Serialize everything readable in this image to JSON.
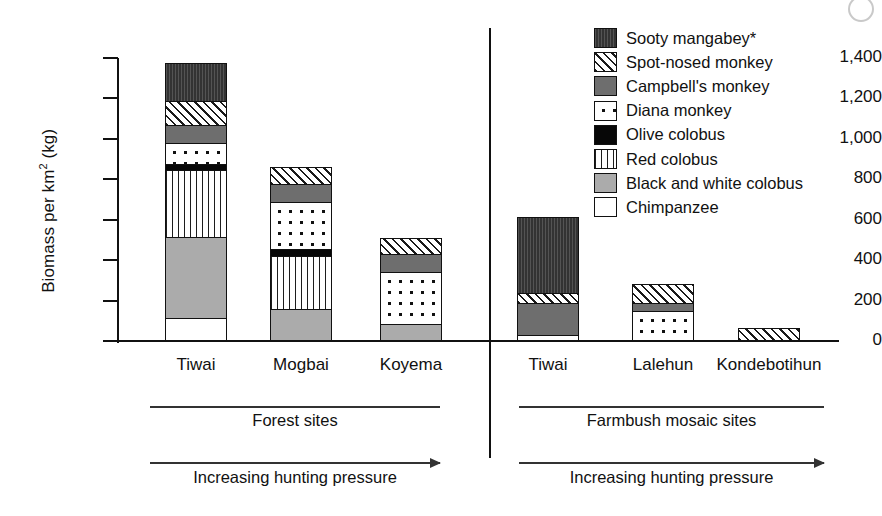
{
  "chart_data": {
    "type": "bar",
    "title": "",
    "xlabel": "",
    "ylabel": "Biomass per km2 (kg)",
    "ylabel_prefix": "Biomass per km",
    "ylabel_sup": "2",
    "ylabel_suffix": " (kg)",
    "stacked": true,
    "ylim": [
      0,
      1400
    ],
    "ytick_values": [
      1400,
      1200,
      1000,
      800,
      600,
      400,
      200,
      0
    ],
    "ytick_labels": [
      "1,400",
      "1,200",
      "1,000",
      "800",
      "600",
      "400",
      "200",
      "0"
    ],
    "grid": false,
    "legend_position": "right",
    "categories": [
      "Tiwai",
      "Mogbai",
      "Koyema",
      "Tiwai",
      "Lalehun",
      "Kondebotihun"
    ],
    "series": [
      {
        "name": "Sooty mangabey*",
        "pattern": "dark-dotted-fill",
        "values": [
          185,
          0,
          0,
          380,
          0,
          0
        ]
      },
      {
        "name": "Spot-nosed monkey",
        "pattern": "diagonal-hatch",
        "values": [
          120,
          80,
          75,
          50,
          90,
          65
        ]
      },
      {
        "name": "Campbell's monkey",
        "pattern": "solid-gray",
        "values": [
          90,
          90,
          90,
          160,
          40,
          0
        ]
      },
      {
        "name": "Diana monkey",
        "pattern": "white-dots",
        "values": [
          105,
          235,
          265,
          25,
          150,
          0
        ]
      },
      {
        "name": "Olive colobus",
        "pattern": "solid-black",
        "values": [
          30,
          35,
          0,
          0,
          0,
          0
        ]
      },
      {
        "name": "Red colobus",
        "pattern": "vertical-stripes",
        "values": [
          330,
          265,
          0,
          0,
          0,
          0
        ]
      },
      {
        "name": "Black and white colobus",
        "pattern": "light-gray",
        "values": [
          405,
          155,
          80,
          0,
          0,
          0
        ]
      },
      {
        "name": "Chimpanzee",
        "pattern": "white",
        "values": [
          110,
          0,
          0,
          0,
          0,
          0
        ]
      }
    ],
    "totals": [
      1375,
      860,
      510,
      615,
      280,
      65
    ],
    "annotations": [
      {
        "group": "forest",
        "caption": "Forest sites",
        "arrow_caption": "Increasing hunting pressure"
      },
      {
        "group": "farmbush",
        "caption": "Farmbush mosaic sites",
        "arrow_caption": "Increasing hunting pressure"
      }
    ]
  },
  "legend": {
    "items": [
      {
        "label": "Sooty mangabey*"
      },
      {
        "label": "Spot-nosed monkey"
      },
      {
        "label": "Campbell's monkey"
      },
      {
        "label": "Diana monkey"
      },
      {
        "label": "Olive colobus"
      },
      {
        "label": "Red colobus"
      },
      {
        "label": "Black and white colobus"
      },
      {
        "label": "Chimpanzee"
      }
    ]
  },
  "axis": {
    "ticks": [
      {
        "label": "1,400"
      },
      {
        "label": "1,200"
      },
      {
        "label": "1,000"
      },
      {
        "label": "800"
      },
      {
        "label": "600"
      },
      {
        "label": "400"
      },
      {
        "label": "200"
      },
      {
        "label": "0"
      }
    ]
  },
  "xaxis": {
    "labels": [
      {
        "label": "Tiwai"
      },
      {
        "label": "Mogbai"
      },
      {
        "label": "Koyema"
      },
      {
        "label": "Tiwai"
      },
      {
        "label": "Lalehun"
      },
      {
        "label": "Kondebotihun"
      }
    ]
  },
  "groups": {
    "forest": {
      "caption": "Forest sites",
      "arrow": "Increasing hunting pressure"
    },
    "farmbush": {
      "caption": "Farmbush mosaic sites",
      "arrow": "Increasing hunting pressure"
    }
  },
  "colors": {
    "mangabey": "#333333",
    "campbell": "#6e6e6e",
    "olive": "#070707",
    "bwcolobus": "#ababab",
    "ink": "#111111",
    "background": "#ffffff"
  }
}
